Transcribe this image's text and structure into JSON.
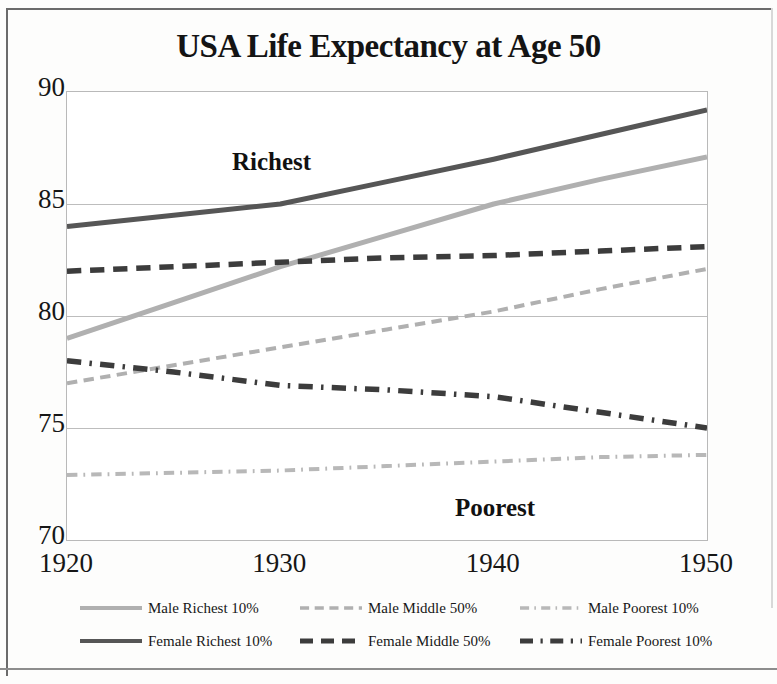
{
  "chart_data": {
    "type": "line",
    "title": "USA Life Expectancy at Age 50",
    "xlabel": "",
    "ylabel": "",
    "x": [
      1920,
      1925,
      1930,
      1935,
      1940,
      1945,
      1950
    ],
    "xtick_labels": [
      "1920",
      "1930",
      "1940",
      "1950"
    ],
    "ytick_labels": [
      "70",
      "75",
      "80",
      "85",
      "90"
    ],
    "ylim": [
      70,
      90
    ],
    "xlim": [
      1920,
      1950
    ],
    "grid": "horizontal",
    "legend_position": "bottom",
    "annotations": [
      {
        "text": "Richest",
        "x": 1922.5,
        "y": 86.2
      },
      {
        "text": "Poorest",
        "x": 1938.5,
        "y": 70.9
      }
    ],
    "series": [
      {
        "name": "Male Richest 10%",
        "style": "solid",
        "color": "#b0b0b0",
        "values": [
          79.0,
          80.6,
          82.2,
          83.6,
          85.0,
          86.1,
          87.1
        ]
      },
      {
        "name": "Male Middle 50%",
        "style": "dashed",
        "color": "#b0b0b0",
        "values": [
          77.0,
          77.8,
          78.6,
          79.4,
          80.2,
          81.2,
          82.1
        ]
      },
      {
        "name": "Male Poorest 10%",
        "style": "dash-dot",
        "color": "#b8b8b8",
        "values": [
          72.9,
          73.0,
          73.1,
          73.3,
          73.5,
          73.7,
          73.8
        ]
      },
      {
        "name": "Female Richest 10%",
        "style": "solid",
        "color": "#565656",
        "values": [
          84.0,
          84.5,
          85.0,
          86.0,
          87.0,
          88.1,
          89.2
        ]
      },
      {
        "name": "Female Middle 50%",
        "style": "dashed",
        "color": "#3c3c3c",
        "values": [
          82.0,
          82.2,
          82.4,
          82.6,
          82.7,
          82.9,
          83.1
        ]
      },
      {
        "name": "Female Poorest 10%",
        "style": "dash-dot",
        "color": "#3c3c3c",
        "values": [
          78.0,
          77.5,
          76.9,
          76.7,
          76.4,
          75.7,
          75.0
        ]
      }
    ]
  },
  "legend": {
    "rows": [
      {
        "entries": [
          {
            "label": "Male Richest 10%",
            "series": 0
          },
          {
            "label": "Male Middle 50%",
            "series": 1
          },
          {
            "label": "Male Poorest 10%",
            "series": 2
          }
        ]
      },
      {
        "entries": [
          {
            "label": "Female Richest 10%",
            "series": 3
          },
          {
            "label": "Female Middle 50%",
            "series": 4
          },
          {
            "label": "Female Poorest 10%",
            "series": 5
          }
        ]
      }
    ]
  }
}
